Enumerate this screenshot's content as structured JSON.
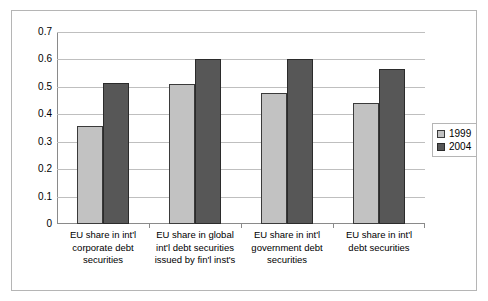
{
  "chart_data": {
    "type": "bar",
    "title": "",
    "subtitle": "",
    "xlabel": "",
    "ylabel": "",
    "ylim": [
      0,
      0.7
    ],
    "yticks": [
      "0",
      "0.1",
      "0.2",
      "0.3",
      "0.4",
      "0.5",
      "0.6",
      "0.7"
    ],
    "ytick_values": [
      0,
      0.1,
      0.2,
      0.3,
      0.4,
      0.5,
      0.6,
      0.7
    ],
    "grid": true,
    "legend_position": "right",
    "categories": [
      "EU share in int'l corporate debt securities",
      "EU share in global int'l debt securities issued by fin'l inst's",
      "EU share in int'l government debt securities",
      "EU share in int'l debt securities"
    ],
    "category_lines": [
      [
        "EU share in int'l",
        "corporate debt",
        "securities"
      ],
      [
        "EU share in global",
        "int'l debt securities",
        "issued by fin'l inst's"
      ],
      [
        "EU share in int'l",
        "government debt",
        "securities"
      ],
      [
        "EU share in int'l",
        "debt securities"
      ]
    ],
    "series": [
      {
        "name": "1999",
        "color": "#c2c2c2",
        "values": [
          0.357,
          0.511,
          0.476,
          0.44
        ]
      },
      {
        "name": "2004",
        "color": "#575757",
        "values": [
          0.515,
          0.601,
          0.602,
          0.565
        ]
      }
    ]
  },
  "legend": {
    "items": [
      {
        "label": "1999"
      },
      {
        "label": "2004"
      }
    ]
  }
}
